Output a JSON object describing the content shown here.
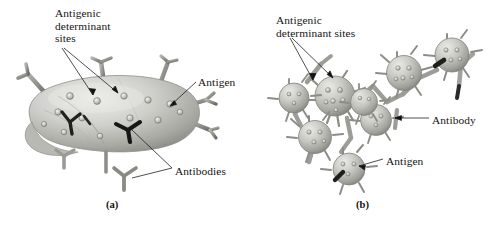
{
  "figure": {
    "background_color": "#ffffff",
    "ink_color": "#141414",
    "body_fill": "#c6c6c2",
    "body_shadow": "#8d8d89",
    "body_highlight": "#e6e6e3",
    "antibody_color": "#9a9a96",
    "antibody_dark": "#1c1c1c"
  },
  "panels": [
    {
      "id": "a",
      "caption": "(a)",
      "labels": [
        {
          "name": "antigenic-determinant-sites",
          "lines": [
            "Antigenic",
            "determinant",
            "sites"
          ],
          "text": "Antigenic\ndeterminant\nsites",
          "x": 55,
          "y": 7
        },
        {
          "name": "antigen",
          "lines": [
            "Antigen"
          ],
          "text": "Antigen",
          "x": 198,
          "y": 76
        },
        {
          "name": "antibodies",
          "lines": [
            "Antibodies"
          ],
          "text": "Antibodies",
          "x": 175,
          "y": 165
        }
      ]
    },
    {
      "id": "b",
      "caption": "(b)",
      "labels": [
        {
          "name": "antigenic-determinant-sites",
          "lines": [
            "Antigenic",
            "determinant sites"
          ],
          "text": "Antigenic\ndeterminant sites",
          "x": 276,
          "y": 14
        },
        {
          "name": "antibody",
          "lines": [
            "Antibody"
          ],
          "text": "Antibody",
          "x": 432,
          "y": 114
        },
        {
          "name": "antigen",
          "lines": [
            "Antigen"
          ],
          "text": "Antigen",
          "x": 386,
          "y": 155
        }
      ]
    }
  ]
}
